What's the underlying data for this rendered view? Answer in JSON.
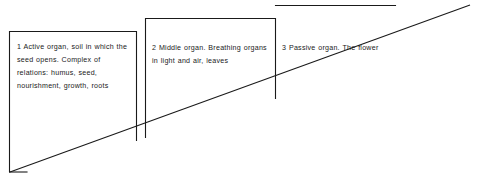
{
  "diagram": {
    "background_color": "#ffffff",
    "line_color": "#1a1a1a",
    "steps": [
      {
        "number": "1",
        "name": "active-organ",
        "text": "1  Active organ, soil in which the seed opens. Complex of relations: humus, seed, nourishment, growth, roots",
        "box": {
          "x": 9,
          "y": 31,
          "width": 127,
          "height": 109
        }
      },
      {
        "number": "2",
        "name": "middle-organ",
        "text": "2  Middle organ. Breathing organs in light and air, leaves",
        "box": {
          "x": 145,
          "y": 18,
          "width": 130,
          "height": 119
        }
      },
      {
        "number": "3",
        "name": "passive-organ",
        "text": "3  Passive organ. The flower",
        "box": {
          "x": 275,
          "y": 5,
          "width": 120,
          "height": 93
        }
      }
    ],
    "diagonal": {
      "name": "ascending-diagonal",
      "from": {
        "x": 10,
        "y": 172
      },
      "to": {
        "x": 470,
        "y": 5
      }
    }
  }
}
